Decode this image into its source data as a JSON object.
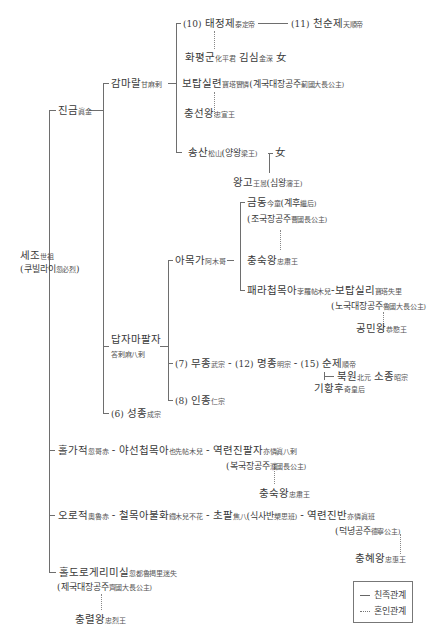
{
  "diagram": {
    "type": "genealogy-tree",
    "root": {
      "name": "세조",
      "hanja": "世祖",
      "alt": "쿠빌라이",
      "alt_hanja": "忽必烈"
    },
    "nodes": {
      "jingeum": {
        "name": "진금",
        "hanja": "眞金"
      },
      "gamarala": {
        "name": "감마랄",
        "hanja": "甘麻剌"
      },
      "taejeongje": {
        "num": "(10)",
        "name": "태정제",
        "hanja": "泰定帝"
      },
      "cheonsunje": {
        "num": "(11)",
        "name": "천순제",
        "hanja": "天順帝"
      },
      "hwapyeonggun": {
        "name": "화평군",
        "hanja": "化平君",
        "name2": "김심",
        "hanja2": "金深",
        "suffix": "女"
      },
      "botapsillyeon": {
        "name": "보탑실련",
        "hanja": "寶塔實憐",
        "title": "(계국대장공주",
        "title_hanja": "薊國大長公主)"
      },
      "chungseonwang": {
        "name": "충선왕",
        "hanja": "忠宣王"
      },
      "songsan": {
        "name": "송산",
        "hanja": "松山",
        "title": "(양왕",
        "title_hanja": "梁王)",
        "suffix": "女"
      },
      "wanggo": {
        "name": "왕고",
        "hanja": "王暠",
        "title": "(심왕",
        "title_hanja": "瀋王)"
      },
      "damjamapalja": {
        "name": "답자마팔자",
        "hanja": "答剌麻八剌"
      },
      "amokga": {
        "name": "아목가",
        "hanja": "阿木哥"
      },
      "geumdong": {
        "name": "금동",
        "hanja": "今童",
        "title": "(계후",
        "title_hanja": "繼后)",
        "title2": "(조국장공주",
        "title2_hanja": "曹國長公主)"
      },
      "chungsukwang1": {
        "name": "충숙왕",
        "hanja": "忠肅王"
      },
      "paerachammoka": {
        "name": "패라첩목아",
        "hanja": "孛羅帖木兒",
        "spouse": "보탑실리",
        "spouse_hanja": "寶塔失里",
        "title": "(노국대장공주",
        "title_hanja": "魯國大長公主)"
      },
      "gongminwang": {
        "name": "공민왕",
        "hanja": "恭愍王"
      },
      "mujong": {
        "num": "(7)",
        "name": "무종",
        "hanja": "武宗"
      },
      "myeongjong": {
        "num": "(12)",
        "name": "명종",
        "hanja": "明宗"
      },
      "sunje": {
        "num": "(15)",
        "name": "순제",
        "hanja": "順帝"
      },
      "bugwon": {
        "name": "북원",
        "hanja": "北元",
        "name2": "소종",
        "hanja2": "昭宗"
      },
      "gihwanghu": {
        "name": "기황후",
        "hanja": "奇皇后"
      },
      "injong": {
        "num": "(8)",
        "name": "인종",
        "hanja": "仁宗"
      },
      "seongjong": {
        "num": "(6)",
        "name": "성종",
        "hanja": "成宗"
      },
      "holgajeok": {
        "name": "홀가적",
        "hanja": "忽哥赤"
      },
      "yaseonchammoka": {
        "name": "야선첩목아",
        "hanja": "也先帖木兒"
      },
      "yeongnyeonjinpalja": {
        "name": "역련진팔자",
        "hanja": "亦憐眞八剌",
        "title": "(복국장공주",
        "title_hanja": "濮國長公主)"
      },
      "chungsukwang2": {
        "name": "충숙왕",
        "hanja": "忠肅王"
      },
      "orojeok": {
        "name": "오로적",
        "hanja": "奧魯赤"
      },
      "cheolmokabulhwa": {
        "name": "철목아불화",
        "hanja": "鐵木兒不花"
      },
      "chopal": {
        "name": "초팔",
        "hanja": "焦八",
        "title": "(식사반",
        "title_hanja": "槊思班)"
      },
      "yeongnyeonjinban": {
        "name": "역련진반",
        "hanja": "亦憐眞班",
        "title": "(덕녕공주",
        "title_hanja": "德寧公主)"
      },
      "chunghyewang": {
        "name": "충혜왕",
        "hanja": "忠惠王"
      },
      "holdorogerimisil": {
        "name": "홀도로게리미실",
        "hanja": "忽都魯揭里迷失",
        "title": "(제국대장공주",
        "title_hanja": "齊國大長公主)"
      },
      "chungnyeolwang": {
        "name": "충렬왕",
        "hanja": "忠烈王"
      }
    },
    "connector": "-",
    "legend": {
      "kin": "친족관계",
      "marriage": "혼인관계"
    }
  }
}
